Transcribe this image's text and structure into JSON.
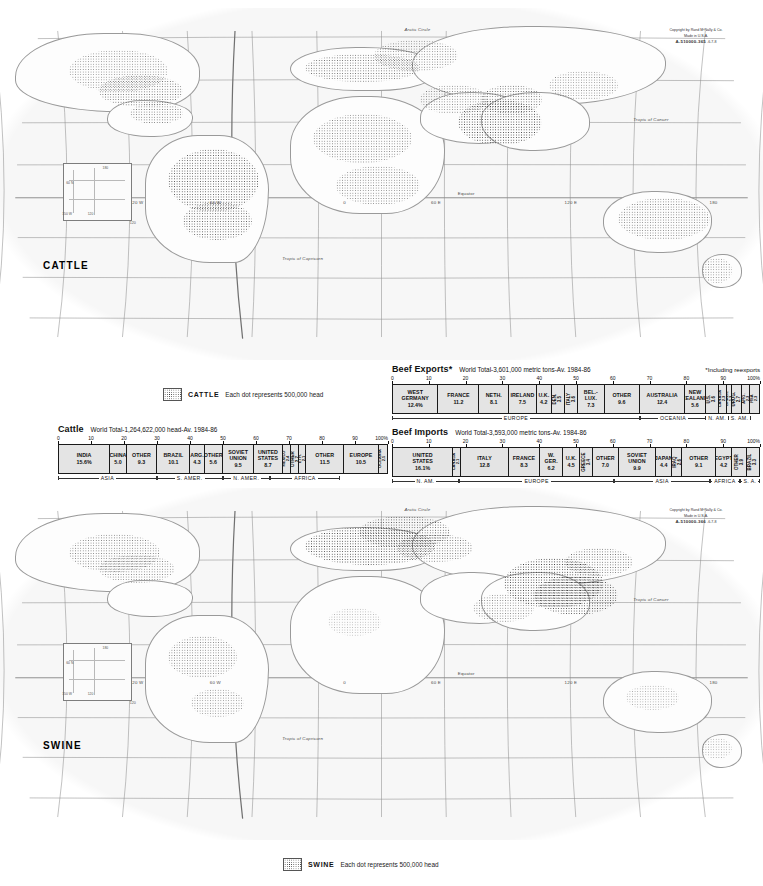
{
  "document": {
    "title": "World Livestock Distribution — Cattle and Swine",
    "publisher_line1": "Copyright by Rand MᶜNally & Co.",
    "publisher_line2": "Made in U.S.A.",
    "plate_cattle": "A-510000-365",
    "plate_cattle_suffix": "-6-7-8",
    "plate_swine": "A-510000-366",
    "plate_swine_suffix": "-6-7-8"
  },
  "maps": [
    {
      "id": "cattle-map",
      "title": "CATTLE",
      "labels": [
        "Arctic Circle",
        "Tropic of Cancer",
        "Equator",
        "Tropic of Capricorn",
        "120 W",
        "60 W",
        "0",
        "60 E",
        "120 E",
        "180"
      ],
      "inset_labels": [
        "180",
        "60 N",
        "120",
        "150 W"
      ]
    },
    {
      "id": "swine-map",
      "title": "SWINE",
      "labels": [
        "Arctic Circle",
        "Tropic of Cancer",
        "Equator",
        "Tropic of Capricorn",
        "120 W",
        "60 W",
        "0",
        "60 E",
        "120 E",
        "180"
      ],
      "inset_labels": [
        "180",
        "60 N",
        "120",
        "150 W"
      ]
    }
  ],
  "legends": [
    {
      "id": "cattle-legend",
      "name": "CATTLE",
      "desc": "Each dot represents 500,000 head"
    },
    {
      "id": "swine-legend",
      "name": "SWINE",
      "desc": "Each dot represents 500,000 head"
    }
  ],
  "chart_data": [
    {
      "id": "cattle-chart",
      "type": "bar",
      "orientation": "stacked-horizontal-100",
      "title": "Cattle",
      "subtitle": "World Total-1,264,622,000 head-Av. 1984-86",
      "note": "",
      "xlabel": "",
      "ylabel": "",
      "axis_ticks": [
        "0",
        "10",
        "20",
        "30",
        "40",
        "50",
        "60",
        "70",
        "80",
        "90",
        "100%"
      ],
      "axis_range": [
        0,
        100
      ],
      "unit": "percent of world total",
      "categories": [
        "INDIA",
        "CHINA",
        "OTHER",
        "BRAZIL",
        "ARG.",
        "OTHER",
        "SOVIET UNION",
        "UNITED STATES",
        "MEXICO",
        "OTHER",
        "ETH.",
        "OTHER",
        "EUROPE",
        "OCEANIA"
      ],
      "values": [
        15.6,
        5.0,
        9.3,
        10.1,
        4.3,
        5.6,
        9.5,
        8.7,
        2.4,
        2.7,
        2.1,
        11.5,
        10.5,
        2.5
      ],
      "value_labels": [
        "15.6%",
        "5.0",
        "9.3",
        "10.1",
        "4.3",
        "5.6",
        "9.5",
        "8.7",
        "2.4",
        "2.7",
        "2.1",
        "11.5",
        "10.5",
        "2.5"
      ],
      "regions": [
        {
          "name": "ASIA",
          "start": 0,
          "end": 29.9
        },
        {
          "name": "S. AMER.",
          "start": 29.9,
          "end": 49.9
        },
        {
          "name": "N. AMER.",
          "start": 49.9,
          "end": 64.2
        },
        {
          "name": "AFRICA",
          "start": 64.2,
          "end": 85.5
        }
      ]
    },
    {
      "id": "beef-exports-chart",
      "type": "bar",
      "orientation": "stacked-horizontal-100",
      "title": "Beef Exports*",
      "subtitle": "World Total-3,601,000 metric tons-Av. 1984-86",
      "note": "*Including reexports",
      "xlabel": "",
      "ylabel": "",
      "axis_ticks": [
        "0",
        "10",
        "20",
        "30",
        "40",
        "50",
        "60",
        "70",
        "80",
        "90",
        "100%"
      ],
      "axis_range": [
        0,
        100
      ],
      "unit": "percent of world total",
      "categories": [
        "WEST GERMANY",
        "FRANCE",
        "NETH.",
        "IRELAND",
        "U.K.",
        "DEN.",
        "ITALY",
        "BEL.-LUX.",
        "OTHER",
        "AUSTRALIA",
        "NEW ZEALAND",
        "U.S.",
        "CANADA",
        "BRAZIL",
        "URUG.",
        "ARG.",
        "RSA"
      ],
      "values": [
        12.4,
        11.2,
        8.1,
        7.5,
        4.2,
        3.5,
        3.6,
        7.3,
        9.6,
        12.4,
        5.6,
        3.6,
        2.3,
        1.3,
        2.7,
        2.3,
        2.3
      ],
      "value_labels": [
        "12.4%",
        "11.2",
        "8.1",
        "7.5",
        "4.2",
        "3.5",
        "3.6",
        "7.3",
        "9.6",
        "12.4",
        "5.6",
        "3.6",
        "2.3",
        "1.3",
        "2.7",
        "2.3",
        "2.3"
      ],
      "regions": [
        {
          "name": "EUROPE",
          "start": 0,
          "end": 67.4
        },
        {
          "name": "OCEANIA",
          "start": 67.4,
          "end": 85.4
        },
        {
          "name": "N. AM.",
          "start": 85.4,
          "end": 91.3
        },
        {
          "name": "S. AM.",
          "start": 91.3,
          "end": 97.6
        }
      ]
    },
    {
      "id": "beef-imports-chart",
      "type": "bar",
      "orientation": "stacked-horizontal-100",
      "title": "Beef Imports",
      "subtitle": "World Total-3,593,000 metric tons-Av. 1984-86",
      "note": "",
      "xlabel": "",
      "ylabel": "",
      "axis_ticks": [
        "0",
        "10",
        "20",
        "30",
        "40",
        "50",
        "60",
        "70",
        "80",
        "90",
        "100%"
      ],
      "axis_range": [
        0,
        100
      ],
      "unit": "percent of world total",
      "categories": [
        "UNITED STATES",
        "CANADA",
        "ITALY",
        "FRANCE",
        "W. GER.",
        "U.K.",
        "GREECE",
        "OTHER",
        "SOVIET UNION",
        "JAPAN",
        "IRAQ",
        "OTHER",
        "EGYPT",
        "OTHER",
        "BRAZIL"
      ],
      "values": [
        16.1,
        2.1,
        12.8,
        8.3,
        6.2,
        4.5,
        3.4,
        7.0,
        9.9,
        4.4,
        2.6,
        9.1,
        4.2,
        3.9,
        3.3
      ],
      "value_labels": [
        "16.1%",
        "2.1",
        "12.8",
        "8.3",
        "6.2",
        "4.5",
        "3.4",
        "7.0",
        "9.9",
        "4.4",
        "2.6",
        "9.1",
        "4.2",
        "3.9",
        "3.3"
      ],
      "regions": [
        {
          "name": "N. AM.",
          "start": 0,
          "end": 18.2
        },
        {
          "name": "EUROPE",
          "start": 18.2,
          "end": 60.4
        },
        {
          "name": "ASIA",
          "start": 60.4,
          "end": 86.4
        },
        {
          "name": "AFRICA",
          "start": 86.4,
          "end": 94.5
        },
        {
          "name": "S. A.",
          "start": 94.5,
          "end": 100
        }
      ]
    }
  ],
  "colors": {
    "bar_fill": "#e4e4e4",
    "bar_stroke": "#1a1a1a",
    "ocean": "#f7f7f7",
    "land": "#fdfdfd",
    "dot": "#2a2a2a",
    "text": "#111111"
  }
}
